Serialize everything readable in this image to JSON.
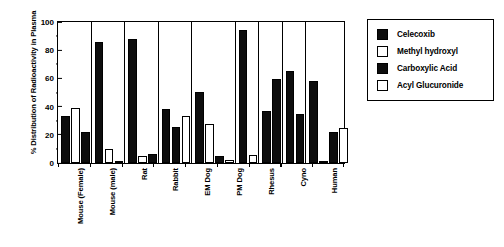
{
  "chart_data": {
    "type": "bar",
    "title": "",
    "xlabel": "",
    "ylabel": "% Distribution of Radioactivity in Plasma",
    "ylim": [
      0,
      100
    ],
    "yticks": [
      0,
      20,
      40,
      60,
      80,
      100
    ],
    "ytick_labels": [
      "0",
      "20",
      "40",
      "60",
      "80",
      "100"
    ],
    "grid": false,
    "legend_position": "right",
    "categories": [
      "Mouse (Female)",
      "Mouse (male)",
      "Rat",
      "Rabbit",
      "EM Dog",
      "PM Dog",
      "Rhesus",
      "Cyno",
      "Human"
    ],
    "series": [
      {
        "name": "Celecoxib",
        "fill": "filled",
        "values": [
          33,
          85.5,
          88,
          38,
          50.5,
          94,
          37,
          65,
          58
        ]
      },
      {
        "name": "Methyl hydroxyl",
        "fill": "open",
        "values": [
          39,
          10,
          5,
          25.5,
          27.5,
          6,
          59.5,
          34.5,
          1.5
        ]
      },
      {
        "name": "Carboxylic Acid",
        "fill": "filled",
        "values": [
          22,
          1.5,
          6.5,
          33,
          5,
          null,
          null,
          null,
          22
        ]
      },
      {
        "name": "Acyl Glucuronide",
        "fill": "open",
        "values": [
          null,
          null,
          null,
          null,
          2,
          null,
          null,
          null,
          24.5
        ]
      }
    ],
    "groups": [
      {
        "category": "Mouse (Female)",
        "bars": [
          {
            "series": "Celecoxib",
            "fill": "filled",
            "value": 33
          },
          {
            "series": "Methyl hydroxyl",
            "fill": "open",
            "value": 39
          },
          {
            "series": "Carboxylic Acid",
            "fill": "filled",
            "value": 22
          }
        ]
      },
      {
        "category": "Mouse (male)",
        "bars": [
          {
            "series": "Celecoxib",
            "fill": "filled",
            "value": 85.5
          },
          {
            "series": "Methyl hydroxyl",
            "fill": "open",
            "value": 10
          },
          {
            "series": "Carboxylic Acid",
            "fill": "filled",
            "value": 1.5
          }
        ]
      },
      {
        "category": "Rat",
        "bars": [
          {
            "series": "Celecoxib",
            "fill": "filled",
            "value": 88
          },
          {
            "series": "Methyl hydroxyl",
            "fill": "open",
            "value": 5
          },
          {
            "series": "Carboxylic Acid",
            "fill": "filled",
            "value": 6.5
          }
        ]
      },
      {
        "category": "Rabbit",
        "bars": [
          {
            "series": "Celecoxib",
            "fill": "filled",
            "value": 38
          },
          {
            "series": "Methyl hydroxyl",
            "fill": "filled",
            "value": 25.5
          },
          {
            "series": "Carboxylic Acid",
            "fill": "open",
            "value": 33
          }
        ]
      },
      {
        "category": "EM Dog",
        "bars": [
          {
            "series": "Celecoxib",
            "fill": "filled",
            "value": 50.5
          },
          {
            "series": "Methyl hydroxyl",
            "fill": "open",
            "value": 27.5
          },
          {
            "series": "Carboxylic Acid",
            "fill": "filled",
            "value": 5
          },
          {
            "series": "Acyl Glucuronide",
            "fill": "open",
            "value": 2
          }
        ]
      },
      {
        "category": "PM Dog",
        "bars": [
          {
            "series": "Celecoxib",
            "fill": "filled",
            "value": 94
          },
          {
            "series": "Methyl hydroxyl",
            "fill": "open",
            "value": 6
          }
        ]
      },
      {
        "category": "Rhesus",
        "bars": [
          {
            "series": "Celecoxib",
            "fill": "filled",
            "value": 37
          },
          {
            "series": "Methyl hydroxyl",
            "fill": "filled",
            "value": 59.5
          }
        ]
      },
      {
        "category": "Cyno",
        "bars": [
          {
            "series": "Celecoxib",
            "fill": "filled",
            "value": 65
          },
          {
            "series": "Methyl hydroxyl",
            "fill": "filled",
            "value": 34.5
          }
        ]
      },
      {
        "category": "Human",
        "bars": [
          {
            "series": "Celecoxib",
            "fill": "filled",
            "value": 58
          },
          {
            "series": "Methyl hydroxyl",
            "fill": "open",
            "value": 1.5
          },
          {
            "series": "Carboxylic Acid",
            "fill": "filled",
            "value": 22
          },
          {
            "series": "Acyl Glucuronide",
            "fill": "open",
            "value": 24.5
          }
        ]
      }
    ],
    "legend": [
      {
        "label": "Celecoxib",
        "fill": "filled"
      },
      {
        "label": "Methyl hydroxyl",
        "fill": "open"
      },
      {
        "label": "Carboxylic Acid",
        "fill": "filled"
      },
      {
        "label": "Acyl Glucuronide",
        "fill": "open"
      }
    ],
    "colors": {
      "filled": "#0d0d0d",
      "open": "#ffffff",
      "axis": "#000000",
      "background": "#ffffff"
    }
  }
}
